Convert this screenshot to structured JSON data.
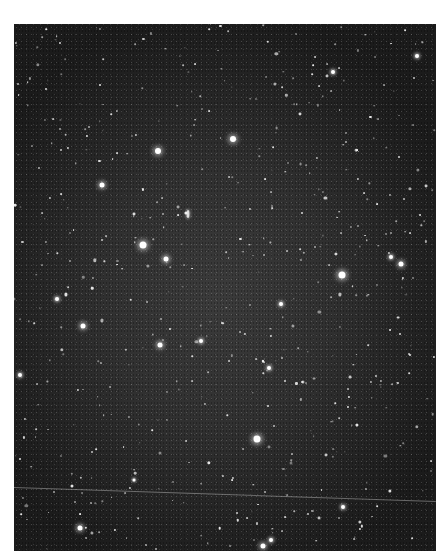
{
  "image": {
    "type": "astronomical-photograph",
    "subject": "star field",
    "frame": {
      "x": 14,
      "y": 24,
      "width": 422,
      "height": 527
    },
    "colors": {
      "sky_center": "#3b3b3b",
      "sky_edge": "#1b1b1b",
      "star": "#ffffff",
      "page": "#ffffff"
    }
  },
  "top_caption": "",
  "bright_stars": [
    {
      "x": 233,
      "y": 139,
      "r": 3
    },
    {
      "x": 158,
      "y": 151,
      "r": 3
    },
    {
      "x": 143,
      "y": 245,
      "r": 3.5
    },
    {
      "x": 166,
      "y": 259,
      "r": 2.5
    },
    {
      "x": 342,
      "y": 275,
      "r": 3.5
    },
    {
      "x": 257,
      "y": 439,
      "r": 3.5
    },
    {
      "x": 391,
      "y": 257,
      "r": 2
    },
    {
      "x": 401,
      "y": 264,
      "r": 2.5
    },
    {
      "x": 102,
      "y": 185,
      "r": 2.5
    },
    {
      "x": 57,
      "y": 299,
      "r": 2
    },
    {
      "x": 83,
      "y": 326,
      "r": 2.5
    },
    {
      "x": 160,
      "y": 345,
      "r": 2.5
    },
    {
      "x": 281,
      "y": 304,
      "r": 2
    },
    {
      "x": 417,
      "y": 56,
      "r": 2
    },
    {
      "x": 333,
      "y": 72,
      "r": 2
    },
    {
      "x": 343,
      "y": 507,
      "r": 2
    },
    {
      "x": 80,
      "y": 528,
      "r": 2.5
    },
    {
      "x": 263,
      "y": 546,
      "r": 2.5
    },
    {
      "x": 271,
      "y": 540,
      "r": 2
    },
    {
      "x": 20,
      "y": 375,
      "r": 2
    },
    {
      "x": 134,
      "y": 480,
      "r": 1.5
    },
    {
      "x": 201,
      "y": 341,
      "r": 2
    },
    {
      "x": 269,
      "y": 368,
      "r": 2
    }
  ],
  "galaxies": [
    {
      "x": 188,
      "y": 214,
      "w": 3,
      "h": 8
    }
  ],
  "satellite_trail": {
    "x1": 0,
    "y1": 463,
    "x2": 422,
    "y2": 477
  }
}
